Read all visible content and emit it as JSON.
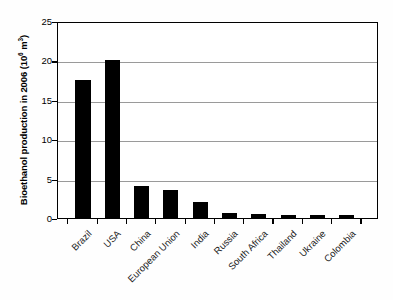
{
  "chart_data": {
    "type": "bar",
    "title": "",
    "xlabel": "",
    "ylabel": "Bioethanol production in 2006 (10⁶ m³)",
    "ylabel_text": "Bioethanol production in 2006 (10",
    "ylabel_sup1": "6",
    "ylabel_mid": " m",
    "ylabel_sup2": "3",
    "ylabel_end": ")",
    "categories": [
      "Brazil",
      "USA",
      "China",
      "European Union",
      "India",
      "Russia",
      "South Africa",
      "Thailand",
      "Ukraine",
      "Colombia"
    ],
    "values": [
      17.5,
      20.0,
      4.1,
      3.5,
      2.0,
      0.65,
      0.45,
      0.4,
      0.35,
      0.35
    ],
    "ylim": [
      0,
      25
    ],
    "yticks": [
      0,
      5,
      10,
      15,
      20,
      25
    ],
    "ytick_labels": [
      "0",
      "5",
      "10",
      "15",
      "20",
      "25"
    ],
    "grid": true,
    "legend": "none",
    "bar_color": "#000000",
    "grid_color": "#9a9a9a",
    "frame_color": "#000000",
    "background": "#ffffff"
  }
}
